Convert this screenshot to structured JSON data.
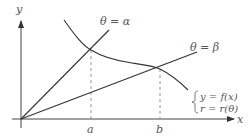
{
  "diagram": {
    "axes": {
      "x_label": "x",
      "y_label": "y"
    },
    "rays": [
      {
        "label": "θ = α",
        "angle_name": "alpha"
      },
      {
        "label": "θ = β",
        "angle_name": "beta"
      }
    ],
    "ticks": {
      "a": "a",
      "b": "b"
    },
    "curve": {
      "equation_cartesian": "y = f(x)",
      "equation_polar": "r = r(θ)"
    },
    "colors": {
      "line": "#333333",
      "text": "#555555",
      "dashed": "#888888"
    }
  }
}
